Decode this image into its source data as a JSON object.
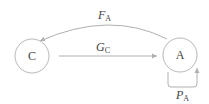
{
  "diagram": {
    "nodes": [
      {
        "id": "C",
        "label": "C"
      },
      {
        "id": "A",
        "label": "A"
      }
    ],
    "edges": [
      {
        "id": "F_A",
        "from": "A",
        "to": "C",
        "label_main": "F",
        "label_sub": "A"
      },
      {
        "id": "G_C",
        "from": "C",
        "to": "A",
        "label_main": "G",
        "label_sub": "C"
      },
      {
        "id": "P_A",
        "from": "A",
        "to": "A",
        "label_main": "P",
        "label_sub": "A"
      }
    ]
  }
}
